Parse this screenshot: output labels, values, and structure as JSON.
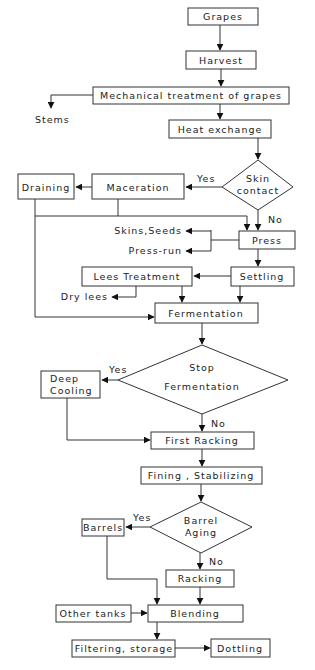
{
  "diagram": {
    "colors": {
      "line": "#333333",
      "box_fill": "#ffffff",
      "text": "#222222"
    },
    "nodes": {
      "grapes": "Grapes",
      "harvest": "Harvest",
      "mechanical": "Mechanical treatment of grapes",
      "stems": "Stems",
      "heat_exchange": "Heat exchange",
      "skin_contact_1": "Skin",
      "skin_contact_2": "contact",
      "maceration": "Maceration",
      "draining": "Draining",
      "press": "Press",
      "skins_seeds": "Skins,Seeds",
      "press_run": "Press-run",
      "settling": "Settling",
      "lees_treatment": "Lees Treatment",
      "dry_lees": "Dry lees",
      "fermentation": "Fermentation",
      "stop_fermentation_1": "Stop",
      "stop_fermentation_2": "Fermentation",
      "deep_cooling_1": "Deep",
      "deep_cooling_2": "Cooling",
      "first_racking": "First Racking",
      "fining": "Fining  , Stabilizing",
      "barrel_aging_1": "Barrel",
      "barrel_aging_2": "Aging",
      "barrels": "Barrels",
      "racking": "Racking",
      "other_tanks": "Other tanks",
      "blending": "Blending",
      "filtering": "Filtering, storage",
      "bottling": "Dottling"
    },
    "edge_labels": {
      "skin_yes": "Yes",
      "skin_no": "No",
      "stop_yes": "Yes",
      "stop_no": "No",
      "barrel_yes": "Yes",
      "barrel_no": "No"
    }
  }
}
